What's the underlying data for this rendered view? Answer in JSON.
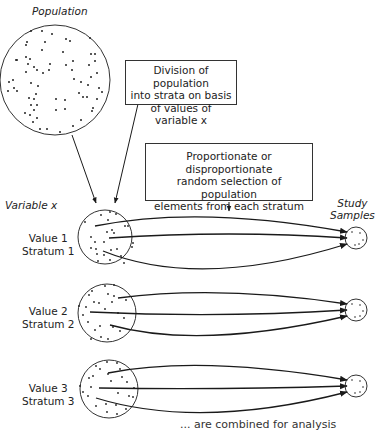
{
  "population": {
    "label": "Population"
  },
  "division_box": {
    "lines": [
      "Division of population",
      "into strata on basis",
      "of values of variable x"
    ]
  },
  "selection_box": {
    "lines": [
      "Proportionate or disproportionate",
      "random selection of population",
      "elements from each stratum"
    ]
  },
  "variable_label": "Variable x",
  "study_samples_label": {
    "lines": [
      "Study",
      "Samples"
    ]
  },
  "strata": [
    {
      "value": "Value 1",
      "stratum": "Stratum 1"
    },
    {
      "value": "Value 2",
      "stratum": "Stratum 2"
    },
    {
      "value": "Value 3",
      "stratum": "Stratum 3"
    }
  ],
  "footer_caption": "... are combined for analysis",
  "colors": {
    "line": "#1a1a1a",
    "dot": "#222222",
    "background": "#ffffff"
  }
}
